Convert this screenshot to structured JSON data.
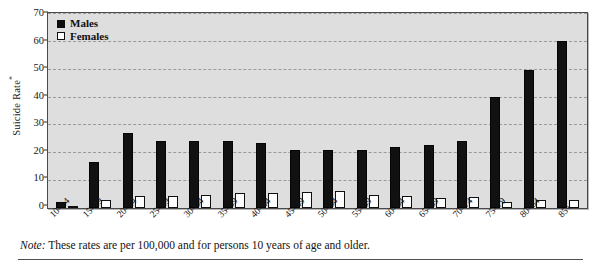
{
  "chart_data": {
    "type": "bar",
    "title": "",
    "subtitle": "",
    "xlabel": "",
    "ylabel": "Suicide Rate*",
    "ylim": [
      0,
      70
    ],
    "yticks": [
      0,
      10,
      20,
      30,
      40,
      50,
      60,
      70
    ],
    "grid": true,
    "legend_position": "top-left inside plot",
    "categories": [
      "10–14",
      "15–19",
      "20–24",
      "25–29",
      "30–34",
      "35–39",
      "40–44",
      "45–49",
      "50–54",
      "55–59",
      "60–64",
      "65–69",
      "70–74",
      "75–79",
      "80–84",
      "85+"
    ],
    "series": [
      {
        "name": "Males",
        "color": "#111111",
        "values": [
          2,
          16.5,
          27,
          24,
          24,
          24,
          23.5,
          21,
          21,
          21,
          22,
          22.5,
          24,
          40,
          49.5,
          60
        ]
      },
      {
        "name": "Females",
        "color": "#ffffff",
        "values": [
          0.7,
          2.8,
          4.3,
          4.3,
          4.5,
          5.5,
          5.5,
          5.8,
          6,
          4.5,
          4.3,
          3.5,
          4,
          2.3,
          3,
          3
        ]
      }
    ],
    "annotations": [
      "Note: These rates are per 100,000 and for persons 10 years of age and older."
    ]
  },
  "legend": {
    "items": [
      {
        "label": "Males",
        "swatch": "filled-black-square"
      },
      {
        "label": "Females",
        "swatch": "open-white-square"
      }
    ]
  },
  "note": {
    "keyword": "Note:",
    "text": "These rates are per 100,000 and for persons 10 years of age and older."
  },
  "axis": {
    "y_title_main": "Suicide Rate",
    "y_title_marker": "*"
  },
  "colors": {
    "plot_background": "#dedede",
    "plot_border": "#4a4a4a",
    "gridline": "#9a9a9a",
    "male_bar": "#111111",
    "female_bar": "#fdfdfd",
    "text": "#141414"
  }
}
